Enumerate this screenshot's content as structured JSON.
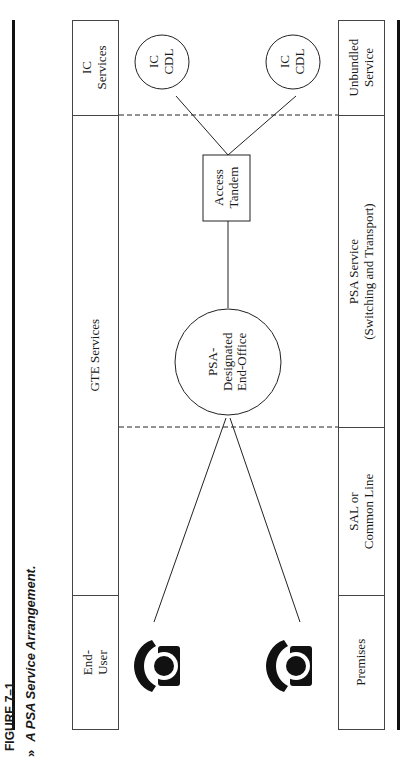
{
  "figure": {
    "number": "FIGURE 7–1",
    "title": "A PSA Service Arrangement.",
    "marker": "»"
  },
  "top_row": {
    "ic_services": [
      "IC",
      "Services"
    ],
    "gte_services": [
      "GTE Services"
    ],
    "end_user": [
      "End-",
      "User"
    ]
  },
  "bottom_row": {
    "unbundled_service": [
      "Unbundled",
      "Service"
    ],
    "psa_service": [
      "PSA Service",
      "(Switching and Transport)"
    ],
    "sal_common_line": [
      "SAL or",
      "Common Line"
    ],
    "premises": [
      "Premises"
    ]
  },
  "nodes": {
    "ic_cdl_1": [
      "IC",
      "CDL"
    ],
    "ic_cdl_2": [
      "IC",
      "CDL"
    ],
    "access_tandem": [
      "Access",
      "Tandem"
    ],
    "psa_end_office": [
      "PSA-",
      "Designated",
      "End-Office"
    ]
  },
  "icons": {
    "phone_1": "telephone-icon",
    "phone_2": "telephone-icon"
  }
}
